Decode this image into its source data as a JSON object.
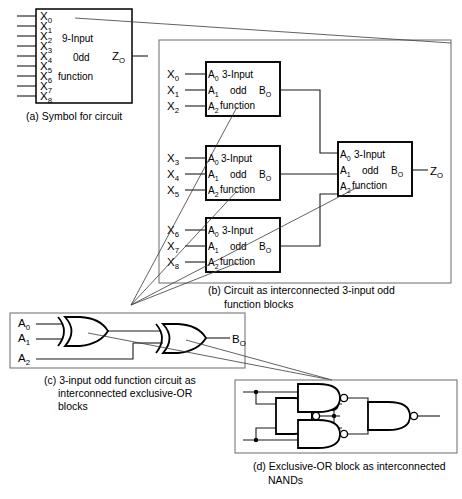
{
  "figure": {
    "colors": {
      "ink": "#000000",
      "wire": "#1a1a1a",
      "group_border": "#777777",
      "background": "#ffffff"
    }
  },
  "panel_a": {
    "caption": "(a) Symbol for circuit",
    "block_lines": [
      "9-Input",
      "0dd",
      "function"
    ],
    "inputs": [
      {
        "base": "X",
        "sub": "0"
      },
      {
        "base": "X",
        "sub": "1"
      },
      {
        "base": "X",
        "sub": "2"
      },
      {
        "base": "X",
        "sub": "3"
      },
      {
        "base": "X",
        "sub": "4"
      },
      {
        "base": "X",
        "sub": "5"
      },
      {
        "base": "X",
        "sub": "6"
      },
      {
        "base": "X",
        "sub": "7"
      },
      {
        "base": "X",
        "sub": "8"
      }
    ],
    "output": {
      "base": "Z",
      "sub": "O"
    }
  },
  "panel_b": {
    "caption_line1": "(b) Circuit as interconnected 3-input odd",
    "caption_line2": "function blocks",
    "blocks": [
      {
        "id": "block-1",
        "lines": [
          "3-Input",
          "odd",
          "function"
        ],
        "pin_labels": [
          {
            "base": "A",
            "sub": "0"
          },
          {
            "base": "A",
            "sub": "1"
          },
          {
            "base": "A",
            "sub": "2"
          }
        ],
        "output_pin": {
          "base": "B",
          "sub": "O"
        },
        "inputs": [
          {
            "base": "X",
            "sub": "0"
          },
          {
            "base": "X",
            "sub": "1"
          },
          {
            "base": "X",
            "sub": "2"
          }
        ]
      },
      {
        "id": "block-2",
        "lines": [
          "3-Input",
          "odd",
          "function"
        ],
        "pin_labels": [
          {
            "base": "A",
            "sub": "0"
          },
          {
            "base": "A",
            "sub": "1"
          },
          {
            "base": "A",
            "sub": "2"
          }
        ],
        "output_pin": {
          "base": "B",
          "sub": "O"
        },
        "inputs": [
          {
            "base": "X",
            "sub": "3"
          },
          {
            "base": "X",
            "sub": "4"
          },
          {
            "base": "X",
            "sub": "5"
          }
        ]
      },
      {
        "id": "block-3",
        "lines": [
          "3-Input",
          "odd",
          "function"
        ],
        "pin_labels": [
          {
            "base": "A",
            "sub": "0"
          },
          {
            "base": "A",
            "sub": "1"
          },
          {
            "base": "A",
            "sub": "2"
          }
        ],
        "output_pin": {
          "base": "B",
          "sub": "O"
        },
        "inputs": [
          {
            "base": "X",
            "sub": "6"
          },
          {
            "base": "X",
            "sub": "7"
          },
          {
            "base": "X",
            "sub": "8"
          }
        ]
      }
    ],
    "merge_block": {
      "id": "block-merge",
      "lines": [
        "3-Input",
        "odd",
        "function"
      ],
      "pin_labels": [
        {
          "base": "A",
          "sub": "0"
        },
        {
          "base": "A",
          "sub": "1"
        },
        {
          "base": "A",
          "sub": "2"
        }
      ],
      "output_pin": {
        "base": "B",
        "sub": "O"
      },
      "output": {
        "base": "Z",
        "sub": "O"
      }
    }
  },
  "panel_c": {
    "caption_line1": "(c) 3-input odd function circuit as",
    "caption_line2": "interconnected exclusive-OR",
    "caption_line3": "blocks",
    "inputs": [
      {
        "base": "A",
        "sub": "0"
      },
      {
        "base": "A",
        "sub": "1"
      },
      {
        "base": "A",
        "sub": "2"
      }
    ],
    "output": {
      "base": "B",
      "sub": "O"
    },
    "gates": [
      {
        "id": "xor-gate-1",
        "type": "xor"
      },
      {
        "id": "xor-gate-2",
        "type": "xor"
      }
    ]
  },
  "panel_d": {
    "caption_line1": "(d) Exclusive-OR block as interconnected",
    "caption_line2": "NANDs",
    "gates": [
      {
        "id": "nand-gate-1",
        "type": "nand"
      },
      {
        "id": "nand-gate-2",
        "type": "nand"
      },
      {
        "id": "nand-gate-3",
        "type": "nand"
      },
      {
        "id": "nand-gate-4",
        "type": "nand"
      }
    ]
  }
}
